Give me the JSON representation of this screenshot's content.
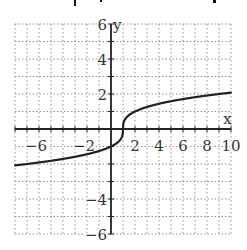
{
  "chart_data": {
    "type": "line",
    "title": "",
    "xlabel": "x",
    "ylabel": "y",
    "xlim": [
      -8,
      10
    ],
    "ylim": [
      -6,
      6
    ],
    "grid": true,
    "grid_style": "dotted",
    "x_ticks": [
      -6,
      -2,
      2,
      4,
      6,
      8,
      10
    ],
    "y_ticks": [
      6,
      4,
      2,
      -4,
      -6
    ],
    "function": "y = cbrt(x - 1)",
    "series": [
      {
        "name": "f(x)",
        "x": [
          -8,
          -7,
          -6,
          -5,
          -4,
          -3,
          -2,
          -1,
          0,
          0.5,
          0.9,
          1,
          1.1,
          1.5,
          2,
          3,
          4,
          5,
          6,
          7,
          8,
          9,
          10
        ],
        "values": [
          -2.08,
          -2.0,
          -1.91,
          -1.82,
          -1.71,
          -1.59,
          -1.44,
          -1.26,
          -1.0,
          -0.79,
          -0.46,
          0,
          0.46,
          0.79,
          1.0,
          1.26,
          1.44,
          1.59,
          1.71,
          1.82,
          1.91,
          2.0,
          2.08
        ],
        "color": "#222222"
      }
    ]
  },
  "colors": {
    "axis": "#222222",
    "grid": "#777777",
    "curve": "#222222",
    "text": "#333333"
  }
}
